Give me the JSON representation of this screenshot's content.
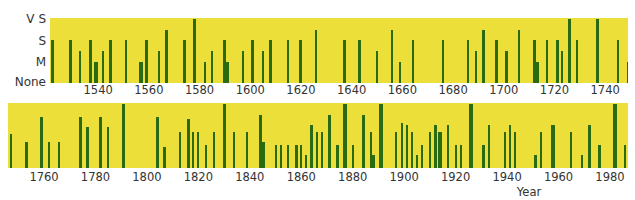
{
  "chart_data": {
    "type": "bar",
    "title": "",
    "xlabel": "Year",
    "ylabel": "",
    "y_levels": [
      "None",
      "M",
      "S",
      "V S"
    ],
    "y_scale_note": "0=None, 1=M, 1.5=between M and S, 2=S, 2.5=between S and VS, 3=VS",
    "ylim": [
      0,
      3
    ],
    "grid": false,
    "legend": null,
    "colors": {
      "background": "#ecdf3a",
      "bar": "#2a6b12"
    },
    "panels": [
      {
        "name": "top",
        "xlim": [
          1521,
          1749
        ],
        "x_ticks": [
          1540,
          1560,
          1580,
          1600,
          1620,
          1640,
          1660,
          1680,
          1700,
          1720,
          1740
        ],
        "points": [
          {
            "year": 1522,
            "value": 2,
            "w": 3
          },
          {
            "year": 1529,
            "value": 2,
            "w": 3
          },
          {
            "year": 1533,
            "value": 1.5,
            "w": 2
          },
          {
            "year": 1537,
            "value": 2,
            "w": 3
          },
          {
            "year": 1539,
            "value": 1,
            "w": 4
          },
          {
            "year": 1542,
            "value": 1.5,
            "w": 2
          },
          {
            "year": 1545,
            "value": 2,
            "w": 3
          },
          {
            "year": 1551,
            "value": 2,
            "w": 2
          },
          {
            "year": 1557,
            "value": 1,
            "w": 4
          },
          {
            "year": 1559,
            "value": 2,
            "w": 3
          },
          {
            "year": 1564,
            "value": 1.5,
            "w": 2
          },
          {
            "year": 1567,
            "value": 2.5,
            "w": 3
          },
          {
            "year": 1574,
            "value": 2,
            "w": 3
          },
          {
            "year": 1578,
            "value": 3,
            "w": 3
          },
          {
            "year": 1582,
            "value": 1,
            "w": 2
          },
          {
            "year": 1585,
            "value": 1.5,
            "w": 2
          },
          {
            "year": 1590,
            "value": 2,
            "w": 3
          },
          {
            "year": 1591,
            "value": 1,
            "w": 3
          },
          {
            "year": 1597,
            "value": 1.5,
            "w": 2
          },
          {
            "year": 1601,
            "value": 2,
            "w": 3
          },
          {
            "year": 1605,
            "value": 1.5,
            "w": 2
          },
          {
            "year": 1608,
            "value": 2,
            "w": 3
          },
          {
            "year": 1615,
            "value": 2,
            "w": 2
          },
          {
            "year": 1620,
            "value": 2,
            "w": 3
          },
          {
            "year": 1626,
            "value": 2.5,
            "w": 2
          },
          {
            "year": 1637,
            "value": 2,
            "w": 3
          },
          {
            "year": 1643,
            "value": 2,
            "w": 3
          },
          {
            "year": 1650,
            "value": 1.5,
            "w": 2
          },
          {
            "year": 1656,
            "value": 2.5,
            "w": 2
          },
          {
            "year": 1659,
            "value": 1,
            "w": 2
          },
          {
            "year": 1664,
            "value": 2,
            "w": 2
          },
          {
            "year": 1676,
            "value": 2,
            "w": 2
          },
          {
            "year": 1686,
            "value": 2,
            "w": 2
          },
          {
            "year": 1689,
            "value": 1.5,
            "w": 2
          },
          {
            "year": 1692,
            "value": 2.5,
            "w": 3
          },
          {
            "year": 1697,
            "value": 2,
            "w": 3
          },
          {
            "year": 1701,
            "value": 1.5,
            "w": 3
          },
          {
            "year": 1706,
            "value": 2.5,
            "w": 2
          },
          {
            "year": 1712,
            "value": 2,
            "w": 3
          },
          {
            "year": 1713,
            "value": 1,
            "w": 4
          },
          {
            "year": 1717,
            "value": 2,
            "w": 2
          },
          {
            "year": 1721,
            "value": 2,
            "w": 3
          },
          {
            "year": 1723,
            "value": 1.5,
            "w": 2
          },
          {
            "year": 1726,
            "value": 3,
            "w": 3
          },
          {
            "year": 1729,
            "value": 2,
            "w": 2
          },
          {
            "year": 1737,
            "value": 3,
            "w": 3
          },
          {
            "year": 1745,
            "value": 2,
            "w": 2
          },
          {
            "year": 1749,
            "value": 1,
            "w": 2
          }
        ]
      },
      {
        "name": "bottom",
        "xlim": [
          1746,
          1987
        ],
        "x_ticks": [
          1760,
          1780,
          1800,
          1820,
          1840,
          1860,
          1880,
          1900,
          1920,
          1940,
          1960,
          1980
        ],
        "points": [
          {
            "year": 1747,
            "value": 1.6,
            "w": 2
          },
          {
            "year": 1753,
            "value": 1.2,
            "w": 3
          },
          {
            "year": 1759,
            "value": 2.4,
            "w": 3
          },
          {
            "year": 1762,
            "value": 1.2,
            "w": 2
          },
          {
            "year": 1766,
            "value": 1.2,
            "w": 2
          },
          {
            "year": 1774,
            "value": 2.4,
            "w": 3
          },
          {
            "year": 1777,
            "value": 1.9,
            "w": 3
          },
          {
            "year": 1782,
            "value": 2.4,
            "w": 3
          },
          {
            "year": 1785,
            "value": 1.9,
            "w": 2
          },
          {
            "year": 1791,
            "value": 3,
            "w": 3
          },
          {
            "year": 1804,
            "value": 2.4,
            "w": 3
          },
          {
            "year": 1807,
            "value": 1,
            "w": 3
          },
          {
            "year": 1813,
            "value": 1.7,
            "w": 2
          },
          {
            "year": 1816,
            "value": 2.3,
            "w": 3
          },
          {
            "year": 1818,
            "value": 1.7,
            "w": 2
          },
          {
            "year": 1820,
            "value": 1.7,
            "w": 2
          },
          {
            "year": 1823,
            "value": 1.1,
            "w": 2
          },
          {
            "year": 1826,
            "value": 1.7,
            "w": 2
          },
          {
            "year": 1830,
            "value": 3,
            "w": 3
          },
          {
            "year": 1834,
            "value": 1.7,
            "w": 2
          },
          {
            "year": 1839,
            "value": 1.7,
            "w": 2
          },
          {
            "year": 1844,
            "value": 2.5,
            "w": 3
          },
          {
            "year": 1845,
            "value": 1.2,
            "w": 4
          },
          {
            "year": 1850,
            "value": 1.1,
            "w": 2
          },
          {
            "year": 1852,
            "value": 1.1,
            "w": 2
          },
          {
            "year": 1855,
            "value": 1.1,
            "w": 2
          },
          {
            "year": 1858,
            "value": 1.1,
            "w": 3
          },
          {
            "year": 1860,
            "value": 1.1,
            "w": 2
          },
          {
            "year": 1862,
            "value": 0.6,
            "w": 2
          },
          {
            "year": 1864,
            "value": 2,
            "w": 3
          },
          {
            "year": 1866,
            "value": 1.7,
            "w": 2
          },
          {
            "year": 1868,
            "value": 1.7,
            "w": 2
          },
          {
            "year": 1871,
            "value": 2.5,
            "w": 3
          },
          {
            "year": 1874,
            "value": 1.1,
            "w": 3
          },
          {
            "year": 1877,
            "value": 3,
            "w": 4
          },
          {
            "year": 1880,
            "value": 1.1,
            "w": 2
          },
          {
            "year": 1884,
            "value": 2.5,
            "w": 3
          },
          {
            "year": 1887,
            "value": 1.7,
            "w": 2
          },
          {
            "year": 1888,
            "value": 0.6,
            "w": 4
          },
          {
            "year": 1891,
            "value": 3,
            "w": 4
          },
          {
            "year": 1897,
            "value": 1.7,
            "w": 2
          },
          {
            "year": 1899,
            "value": 2.1,
            "w": 2
          },
          {
            "year": 1901,
            "value": 2,
            "w": 2
          },
          {
            "year": 1903,
            "value": 1.7,
            "w": 2
          },
          {
            "year": 1905,
            "value": 0.6,
            "w": 2
          },
          {
            "year": 1907,
            "value": 1.1,
            "w": 2
          },
          {
            "year": 1910,
            "value": 1.7,
            "w": 2
          },
          {
            "year": 1912,
            "value": 2,
            "w": 3
          },
          {
            "year": 1914,
            "value": 1.7,
            "w": 4
          },
          {
            "year": 1917,
            "value": 2,
            "w": 2
          },
          {
            "year": 1920,
            "value": 1.1,
            "w": 2
          },
          {
            "year": 1922,
            "value": 1.1,
            "w": 2
          },
          {
            "year": 1926,
            "value": 3,
            "w": 4
          },
          {
            "year": 1931,
            "value": 1.1,
            "w": 3
          },
          {
            "year": 1933,
            "value": 2,
            "w": 2
          },
          {
            "year": 1939,
            "value": 1.7,
            "w": 2
          },
          {
            "year": 1941,
            "value": 2,
            "w": 2
          },
          {
            "year": 1943,
            "value": 1.7,
            "w": 2
          },
          {
            "year": 1951,
            "value": 0.6,
            "w": 3
          },
          {
            "year": 1953,
            "value": 1.7,
            "w": 2
          },
          {
            "year": 1958,
            "value": 2,
            "w": 4
          },
          {
            "year": 1965,
            "value": 1.7,
            "w": 2
          },
          {
            "year": 1969,
            "value": 0.6,
            "w": 2
          },
          {
            "year": 1972,
            "value": 2,
            "w": 3
          },
          {
            "year": 1976,
            "value": 1.1,
            "w": 3
          },
          {
            "year": 1982,
            "value": 3,
            "w": 4
          },
          {
            "year": 1986,
            "value": 1.1,
            "w": 2
          }
        ]
      }
    ]
  },
  "labels": {
    "y_vs": "V S",
    "y_s": "S",
    "y_m": "M",
    "y_none": "None",
    "x_title": "Year"
  }
}
